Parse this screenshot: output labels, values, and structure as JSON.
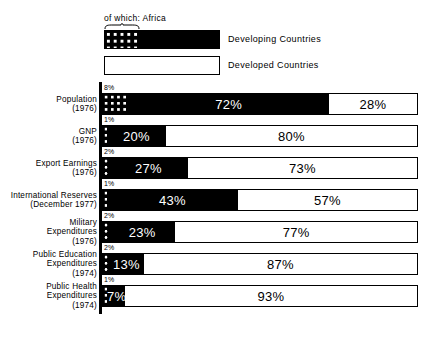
{
  "legend": {
    "africa_note": "of which: Africa",
    "entries": [
      {
        "label": "Developing Countries",
        "swatch": "black-with-dots"
      },
      {
        "label": "Developed Countries",
        "swatch": "white-outline"
      }
    ]
  },
  "chart_data": {
    "type": "bar",
    "title": "",
    "subtitle": "",
    "xlabel": "",
    "ylabel": "",
    "orientation": "horizontal",
    "stacked": true,
    "normalized": true,
    "xlim": [
      0,
      100
    ],
    "grid": false,
    "legend_position": "top-left",
    "units": "%",
    "categories": [
      "Population (1976)",
      "GNP (1976)",
      "Export Earnings (1976)",
      "International Reserves (December 1977)",
      "Military Expenditures (1976)",
      "Public Education Expenditures (1974)",
      "Public Health Expenditures (1974)"
    ],
    "series": [
      {
        "name": "Developing Countries",
        "values": [
          72,
          20,
          27,
          43,
          23,
          13,
          7
        ]
      },
      {
        "name": "Developed Countries",
        "values": [
          28,
          80,
          73,
          57,
          77,
          87,
          93
        ]
      },
      {
        "name": "of which: Africa",
        "note": "sub-segment contained within Developing Countries",
        "values": [
          8,
          1,
          2,
          1,
          2,
          2,
          1
        ]
      }
    ]
  },
  "rows": [
    {
      "label_lines": [
        "Population",
        "(1976)"
      ],
      "label": "Population (1976)",
      "africa_label": "8%",
      "africa_value": 8,
      "developing_label": "72%",
      "developing_value": 72,
      "developed_label": "28%",
      "developed_value": 28
    },
    {
      "label_lines": [
        "GNP",
        "(1976)"
      ],
      "label": "GNP (1976)",
      "africa_label": "1%",
      "africa_value": 1,
      "developing_label": "20%",
      "developing_value": 20,
      "developed_label": "80%",
      "developed_value": 80
    },
    {
      "label_lines": [
        "Export Earnings",
        "(1976)"
      ],
      "label": "Export Earnings (1976)",
      "africa_label": "2%",
      "africa_value": 2,
      "developing_label": "27%",
      "developing_value": 27,
      "developed_label": "73%",
      "developed_value": 73
    },
    {
      "label_lines": [
        "International Reserves",
        "(December 1977)"
      ],
      "label": "International Reserves (December 1977)",
      "africa_label": "1%",
      "africa_value": 1,
      "developing_label": "43%",
      "developing_value": 43,
      "developed_label": "57%",
      "developed_value": 57
    },
    {
      "label_lines": [
        "Military",
        "Expenditures",
        "(1976)"
      ],
      "label": "Military Expenditures (1976)",
      "africa_label": "2%",
      "africa_value": 2,
      "developing_label": "23%",
      "developing_value": 23,
      "developed_label": "77%",
      "developed_value": 77
    },
    {
      "label_lines": [
        "Public Education",
        "Expenditures",
        "(1974)"
      ],
      "label": "Public Education Expenditures (1974)",
      "africa_label": "2%",
      "africa_value": 2,
      "developing_label": "13%",
      "developing_value": 13,
      "developed_label": "87%",
      "developed_value": 87
    },
    {
      "label_lines": [
        "Public Health",
        "Expenditures",
        "(1974)"
      ],
      "label": "Public Health Expenditures (1974)",
      "africa_label": "1%",
      "africa_value": 1,
      "developing_label": "7%",
      "developing_value": 7,
      "developed_label": "93%",
      "developed_value": 93
    }
  ],
  "colors": {
    "developing": "#000000",
    "developed": "#ffffff",
    "outline": "#000000",
    "background": "#ffffff"
  }
}
